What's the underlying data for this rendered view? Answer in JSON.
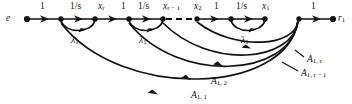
{
  "figure": {
    "type": "signal-flow-graph",
    "width": 352,
    "height": 104,
    "background": "#ffffff",
    "ink": "#111111"
  },
  "nodes": [
    {
      "id": "e",
      "label": "e",
      "x": 27,
      "y": 19,
      "terminal": true
    },
    {
      "id": "n1",
      "label": "",
      "x": 61,
      "y": 19,
      "terminal": false
    },
    {
      "id": "n2",
      "label": "x_r",
      "x": 95,
      "y": 19,
      "terminal": false
    },
    {
      "id": "n3",
      "label": "",
      "x": 129,
      "y": 19,
      "terminal": false
    },
    {
      "id": "n4",
      "label": "x_{r-1}",
      "x": 163,
      "y": 19,
      "terminal": false
    },
    {
      "id": "n5",
      "label": "x_2",
      "x": 197,
      "y": 19,
      "terminal": false
    },
    {
      "id": "n6",
      "label": "",
      "x": 231,
      "y": 19,
      "terminal": false
    },
    {
      "id": "n7",
      "label": "x_1",
      "x": 265,
      "y": 19,
      "terminal": false
    },
    {
      "id": "n8",
      "label": "",
      "x": 299,
      "y": 19,
      "terminal": false
    },
    {
      "id": "r1",
      "label": "r_1",
      "x": 333,
      "y": 19,
      "terminal": true
    }
  ],
  "edge_labels": {
    "gain_unity": "1",
    "gain_inv_s": "1/s",
    "feedback": "λ",
    "feedback_sub": "1"
  },
  "top_labels": [
    {
      "text": "1",
      "kind": "num",
      "x": 40,
      "y": 3
    },
    {
      "text": "1/s",
      "kind": "frac",
      "x": 71,
      "y": 3
    },
    {
      "text": "x",
      "sub": "r",
      "kind": "ital",
      "x": 100,
      "y": 3
    },
    {
      "text": "1",
      "kind": "num",
      "x": 122,
      "y": 3
    },
    {
      "text": "1/s",
      "kind": "frac",
      "x": 140,
      "y": 3
    },
    {
      "text": "x",
      "sub": "r − 1",
      "kind": "ital",
      "x": 166,
      "y": 3
    },
    {
      "text": "x",
      "sub": "2",
      "kind": "ital",
      "x": 196,
      "y": 3
    },
    {
      "text": "1",
      "kind": "num",
      "x": 215,
      "y": 3
    },
    {
      "text": "1/s",
      "kind": "frac",
      "x": 238,
      "y": 3
    },
    {
      "text": "x",
      "sub": "1",
      "kind": "ital",
      "x": 264,
      "y": 3
    },
    {
      "text": "1",
      "kind": "num",
      "x": 311,
      "y": 3
    }
  ],
  "node_end_labels": [
    {
      "text": "e",
      "kind": "ital",
      "x": 8,
      "y": 15
    },
    {
      "text": "r",
      "sub": "1",
      "kind": "ital",
      "x": 339,
      "y": 15
    }
  ],
  "lambda_labels": [
    {
      "text": "λ",
      "sub": "1",
      "x": 73,
      "y": 37
    },
    {
      "text": "λ",
      "sub": "1",
      "x": 141,
      "y": 37
    },
    {
      "text": "λ",
      "sub": "1",
      "x": 243,
      "y": 37
    }
  ],
  "feedback_labels": [
    {
      "text": "A",
      "sub": "1, r",
      "x": 306,
      "y": 58,
      "leader": {
        "x1": 304,
        "y1": 60,
        "x2": 296,
        "y2": 52
      }
    },
    {
      "text": "A",
      "sub": "1, r − 1",
      "x": 300,
      "y": 72,
      "leader": {
        "x1": 298,
        "y1": 74,
        "x2": 284,
        "y2": 64
      }
    },
    {
      "text": "A",
      "sub": "1, 2",
      "x": 213,
      "y": 78,
      "leader": null
    },
    {
      "text": "A",
      "sub": "1, 1",
      "x": 193,
      "y": 92,
      "leader": null
    }
  ],
  "dashed_segment": {
    "x1": 175,
    "y1": 19,
    "x2": 195,
    "y2": 19
  },
  "small_arcs": [
    {
      "from": 61,
      "to": 95,
      "depth": 12
    },
    {
      "from": 129,
      "to": 163,
      "depth": 12
    },
    {
      "from": 231,
      "to": 265,
      "depth": 12
    }
  ],
  "big_arcs": [
    {
      "label": "A_1,r",
      "from": 299,
      "to": 197,
      "depth": 30
    },
    {
      "label": "A_1,r-1",
      "from": 299,
      "to": 163,
      "depth": 48
    },
    {
      "label": "A_1,2",
      "from": 299,
      "to": 129,
      "depth": 62
    },
    {
      "label": "A_1,1",
      "from": 299,
      "to": 61,
      "depth": 78
    }
  ]
}
